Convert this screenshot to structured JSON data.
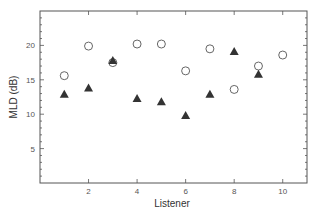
{
  "chart_data": {
    "type": "scatter",
    "title": "",
    "xlabel": "Listener",
    "ylabel": "MLD (dB)",
    "xlim": [
      0,
      11
    ],
    "ylim": [
      0,
      25
    ],
    "x_ticks": [
      2,
      4,
      6,
      8,
      10
    ],
    "y_ticks": [
      5,
      10,
      15,
      20
    ],
    "grid": false,
    "legend": null,
    "series": [
      {
        "name": "open circles",
        "marker": "circle-open",
        "x": [
          1,
          2,
          3,
          4,
          5,
          6,
          7,
          8,
          9,
          10
        ],
        "values": [
          15.6,
          19.9,
          17.5,
          20.2,
          20.2,
          16.3,
          19.5,
          13.6,
          17.0,
          18.6
        ]
      },
      {
        "name": "filled triangles",
        "marker": "triangle-filled",
        "x": [
          1,
          2,
          3,
          4,
          5,
          6,
          7,
          8,
          9
        ],
        "values": [
          12.9,
          13.8,
          17.8,
          12.3,
          11.8,
          9.8,
          12.9,
          19.1,
          15.8
        ]
      }
    ]
  },
  "colors": {
    "axis": "#555555",
    "circle_stroke": "#666666",
    "triangle_fill": "#333333"
  }
}
